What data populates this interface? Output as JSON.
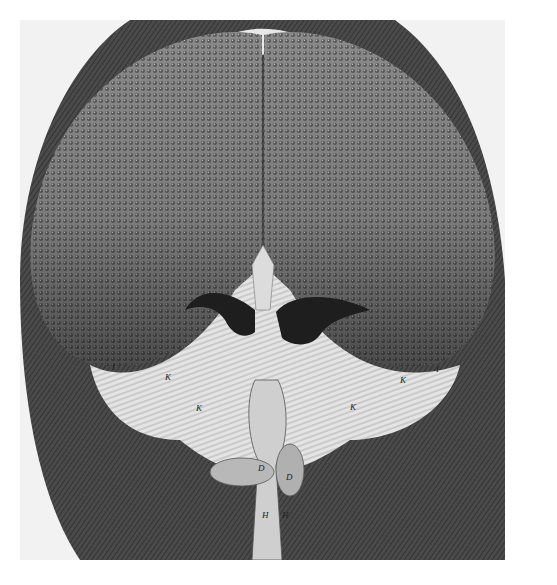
{
  "image": {
    "subject": "Engraving of a fly's head seen from the front, showing two large compound eyes, antennae, hairy face and proboscis",
    "style": "monochrome copperplate engraving",
    "colors": {
      "background": "#ffffff",
      "plate": "#f2f2f2",
      "ink_dark": "#2a2a2a",
      "eye_mid": "#6e6e6e",
      "hair_light": "#e6e6e6"
    }
  },
  "labels": {
    "k1": "K",
    "k2": "K",
    "k3": "K",
    "k4": "K",
    "i1": "I",
    "i2": "I",
    "d1": "D",
    "d2": "D",
    "h1": "H",
    "h2": "H"
  }
}
